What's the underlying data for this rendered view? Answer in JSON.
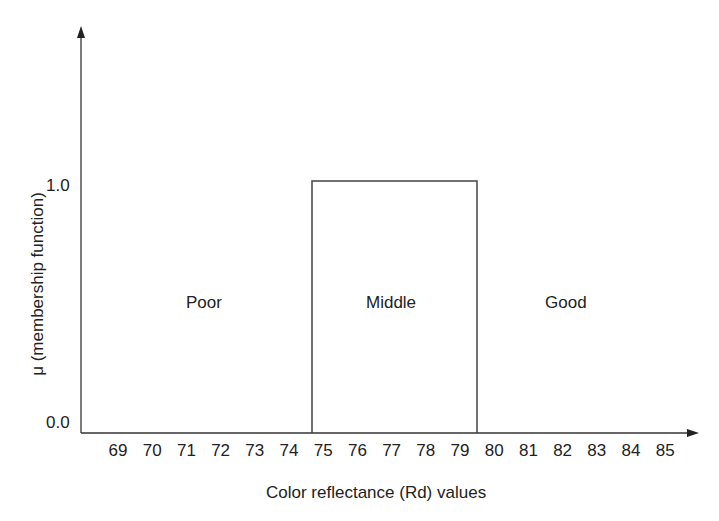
{
  "chart_data": {
    "type": "line",
    "title": "",
    "xlabel": "Color reflectance (Rd) values",
    "ylabel": "μ (membership function)",
    "x_ticks": [
      "69",
      "70",
      "71",
      "72",
      "73",
      "74",
      "75",
      "76",
      "77",
      "78",
      "79",
      "80",
      "81",
      "82",
      "83",
      "84",
      "85"
    ],
    "y_ticks": [
      "0.0",
      "1.0"
    ],
    "ylim": [
      0,
      1
    ],
    "series": [
      {
        "name": "Middle",
        "x": [
          74.5,
          74.5,
          79.5,
          79.5
        ],
        "y": [
          0,
          1,
          1,
          0
        ]
      }
    ],
    "regions": [
      {
        "label": "Poor",
        "range": [
          69,
          74.5
        ]
      },
      {
        "label": "Middle",
        "range": [
          74.5,
          79.5
        ]
      },
      {
        "label": "Good",
        "range": [
          79.5,
          85
        ]
      }
    ],
    "grid": false,
    "legend": "none"
  },
  "labels": {
    "y_axis": "μ (membership function)",
    "x_axis": "Color reflectance (Rd) values",
    "y_tick_0": "0.0",
    "y_tick_1": "1.0",
    "region_poor": "Poor",
    "region_middle": "Middle",
    "region_good": "Good"
  },
  "x_ticks": [
    "69",
    "70",
    "71",
    "72",
    "73",
    "74",
    "75",
    "76",
    "77",
    "78",
    "79",
    "80",
    "81",
    "82",
    "83",
    "84",
    "85"
  ]
}
